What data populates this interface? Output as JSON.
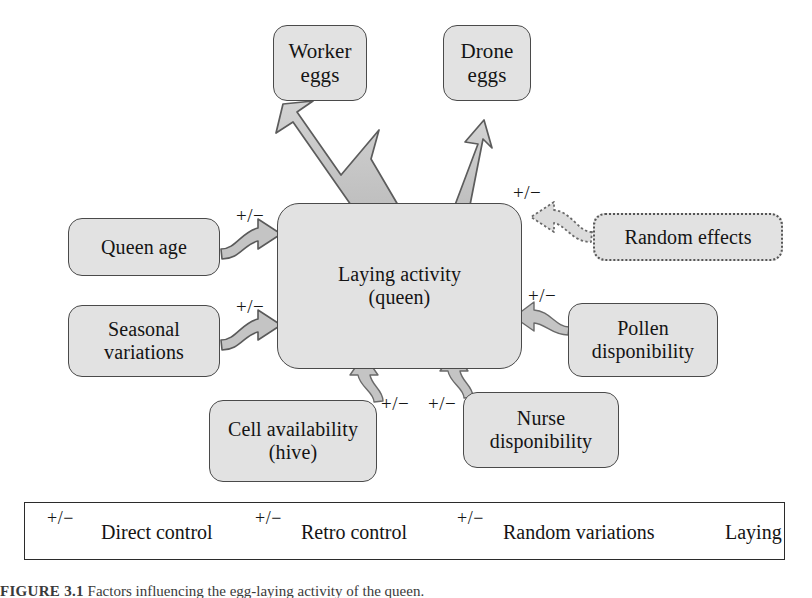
{
  "figure": {
    "type": "influence-diagram",
    "subject": "Factors influencing the egg-laying activity of the queen",
    "center": {
      "line1": "Laying activity",
      "line2": "(queen)"
    },
    "outputs": [
      {
        "id": "worker-eggs",
        "line1": "Worker",
        "line2": "eggs",
        "arrow": "laying",
        "weight": "thick"
      },
      {
        "id": "drone-eggs",
        "line1": "Drone",
        "line2": "eggs",
        "arrow": "laying",
        "weight": "thin"
      }
    ],
    "inputs": [
      {
        "id": "queen-age",
        "line1": "Queen age",
        "line2": "",
        "arrow": "direct-control",
        "sign": "+/−",
        "side": "left"
      },
      {
        "id": "seasonal",
        "line1": "Seasonal",
        "line2": "variations",
        "arrow": "direct-control",
        "sign": "+/−",
        "side": "left"
      },
      {
        "id": "random-effects",
        "line1": "Random effects",
        "line2": "",
        "arrow": "random-variations",
        "sign": "+/−",
        "side": "right",
        "border": "dotted"
      },
      {
        "id": "pollen",
        "line1": "Pollen",
        "line2": "disponibility",
        "arrow": "retro-control",
        "sign": "+/−",
        "side": "right"
      },
      {
        "id": "cell",
        "line1": "Cell availability",
        "line2": "(hive)",
        "arrow": "retro-control",
        "sign": "+/−",
        "side": "bottom"
      },
      {
        "id": "nurse",
        "line1": "Nurse",
        "line2": "disponibility",
        "arrow": "retro-control",
        "sign": "+/−",
        "side": "bottom"
      }
    ],
    "legend": {
      "items": [
        {
          "id": "direct-control",
          "label": "Direct control",
          "sign": "+/−",
          "glyph": "thick-curved-arrow-icon"
        },
        {
          "id": "retro-control",
          "label": "Retro control",
          "sign": "+/−",
          "glyph": "thin-curved-arrow-icon"
        },
        {
          "id": "random-variations",
          "label": "Random variations",
          "sign": "+/−",
          "glyph": "dotted-curved-arrow-icon"
        },
        {
          "id": "laying",
          "label": "Laying",
          "sign": "",
          "glyph": "block-arrow-icon"
        }
      ]
    },
    "caption": {
      "label": "FIGURE 3.1",
      "text": "Factors influencing the egg-laying activity of the queen."
    },
    "colors": {
      "box_fill": "#e2e2e2",
      "box_stroke": "#4a4a4a",
      "arrow_fill": "#c9c9c9",
      "arrow_stroke": "#585858",
      "legend_stroke": "#2b2b2b",
      "text": "#141414",
      "background": "#ffffff"
    }
  }
}
